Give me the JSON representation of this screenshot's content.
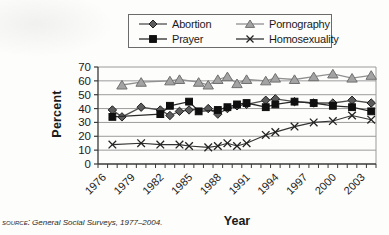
{
  "figure": {
    "source_prefix": "source:",
    "source_text": "General Social Surveys, 1977–2004."
  },
  "chart_data": {
    "type": "line",
    "title": "",
    "xlabel": "Year",
    "ylabel": "Percent",
    "ylim": [
      0,
      70
    ],
    "y_ticks": [
      0,
      10,
      20,
      30,
      40,
      50,
      60,
      70
    ],
    "x_range": [
      1976,
      2004
    ],
    "x_tick_labels": [
      1976,
      1979,
      1982,
      1985,
      1988,
      1991,
      1994,
      1997,
      2000,
      2003
    ],
    "grid": "horizontal",
    "legend_position": "top",
    "colors": {
      "grid": "#9b9b9b",
      "axis": "#3a3a3a",
      "text": "#1b1b1b",
      "legend_border": "#6b6b6b",
      "paper": "#fdfdfb"
    },
    "series": [
      {
        "name": "Abortion",
        "marker": "diamond",
        "line_color": "#4f4f4f",
        "fill": "#5c5c5c",
        "stroke": "#1f1f1f",
        "points": [
          [
            1977,
            39
          ],
          [
            1978,
            34
          ],
          [
            1980,
            41
          ],
          [
            1982,
            39
          ],
          [
            1983,
            35
          ],
          [
            1984,
            38
          ],
          [
            1985,
            39
          ],
          [
            1987,
            40
          ],
          [
            1988,
            36
          ],
          [
            1989,
            40
          ],
          [
            1990,
            42
          ],
          [
            1991,
            43
          ],
          [
            1993,
            46
          ],
          [
            1994,
            47
          ],
          [
            1996,
            45
          ],
          [
            1998,
            44
          ],
          [
            2000,
            44
          ],
          [
            2002,
            46
          ],
          [
            2004,
            44
          ]
        ]
      },
      {
        "name": "Pornography",
        "marker": "triangle",
        "line_color": "#909090",
        "fill": "#a3a3a3",
        "stroke": "#707070",
        "points": [
          [
            1978,
            57
          ],
          [
            1980,
            59
          ],
          [
            1983,
            60
          ],
          [
            1984,
            61
          ],
          [
            1986,
            59
          ],
          [
            1987,
            57
          ],
          [
            1988,
            61
          ],
          [
            1989,
            63
          ],
          [
            1990,
            58
          ],
          [
            1991,
            61
          ],
          [
            1993,
            60
          ],
          [
            1994,
            62
          ],
          [
            1996,
            61
          ],
          [
            1998,
            63
          ],
          [
            2000,
            65
          ],
          [
            2002,
            62
          ],
          [
            2004,
            64
          ]
        ]
      },
      {
        "name": "Prayer",
        "marker": "square",
        "line_color": "#2a2a2a",
        "fill": "#0f0f0f",
        "stroke": "#0f0f0f",
        "points": [
          [
            1977,
            34
          ],
          [
            1982,
            36
          ],
          [
            1983,
            42
          ],
          [
            1985,
            45
          ],
          [
            1986,
            38
          ],
          [
            1988,
            39
          ],
          [
            1989,
            41
          ],
          [
            1990,
            43
          ],
          [
            1991,
            44
          ],
          [
            1993,
            41
          ],
          [
            1994,
            43
          ],
          [
            1996,
            45
          ],
          [
            1998,
            44
          ],
          [
            2000,
            42
          ],
          [
            2002,
            41
          ],
          [
            2004,
            38
          ]
        ]
      },
      {
        "name": "Homosexuality",
        "marker": "x",
        "line_color": "#333333",
        "fill": "none",
        "stroke": "#222222",
        "points": [
          [
            1977,
            14
          ],
          [
            1980,
            15
          ],
          [
            1982,
            14
          ],
          [
            1984,
            14
          ],
          [
            1985,
            13
          ],
          [
            1987,
            12
          ],
          [
            1988,
            13
          ],
          [
            1989,
            15
          ],
          [
            1990,
            13
          ],
          [
            1991,
            15
          ],
          [
            1993,
            21
          ],
          [
            1994,
            23
          ],
          [
            1996,
            27
          ],
          [
            1998,
            30
          ],
          [
            2000,
            31
          ],
          [
            2002,
            35
          ],
          [
            2004,
            32
          ]
        ]
      }
    ]
  }
}
